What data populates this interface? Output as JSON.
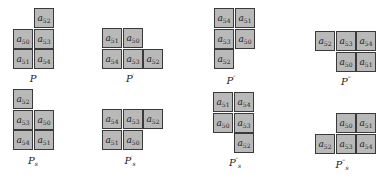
{
  "figure": {
    "cell_size": 20,
    "colors": {
      "cell_fill": "#b9b9b9",
      "cell_border": "#3a3a3a",
      "background": "#ffffff"
    },
    "polyominoes": [
      {
        "id": "P",
        "label": "P",
        "prime": "",
        "sub": "",
        "origin": [
          13,
          8
        ],
        "label_pos": [
          33,
          73
        ],
        "cells": [
          {
            "r": 0,
            "c": 1,
            "var": "a",
            "idx": "52"
          },
          {
            "r": 1,
            "c": 0,
            "var": "a",
            "idx": "50"
          },
          {
            "r": 1,
            "c": 1,
            "var": "a",
            "idx": "53"
          },
          {
            "r": 2,
            "c": 0,
            "var": "a",
            "idx": "51"
          },
          {
            "r": 2,
            "c": 1,
            "var": "a",
            "idx": "54"
          }
        ]
      },
      {
        "id": "P1",
        "label": "P",
        "prime": "′",
        "sub": "",
        "origin": [
          102,
          28
        ],
        "label_pos": [
          130,
          73
        ],
        "cells": [
          {
            "r": 0,
            "c": 0,
            "var": "a",
            "idx": "51"
          },
          {
            "r": 0,
            "c": 1,
            "var": "a",
            "idx": "50"
          },
          {
            "r": 1,
            "c": 0,
            "var": "a",
            "idx": "54"
          },
          {
            "r": 1,
            "c": 1,
            "var": "a",
            "idx": "53"
          },
          {
            "r": 1,
            "c": 2,
            "var": "a",
            "idx": "52"
          }
        ]
      },
      {
        "id": "P2",
        "label": "P",
        "prime": "″",
        "sub": "",
        "origin": [
          214,
          8
        ],
        "label_pos": [
          231,
          75
        ],
        "cells": [
          {
            "r": 0,
            "c": 0,
            "var": "a",
            "idx": "54"
          },
          {
            "r": 0,
            "c": 1,
            "var": "a",
            "idx": "51"
          },
          {
            "r": 1,
            "c": 0,
            "var": "a",
            "idx": "53"
          },
          {
            "r": 1,
            "c": 1,
            "var": "a",
            "idx": "50"
          },
          {
            "r": 2,
            "c": 0,
            "var": "a",
            "idx": "52"
          }
        ]
      },
      {
        "id": "P3",
        "label": "P",
        "prime": "‴",
        "sub": "",
        "origin": [
          315,
          31
        ],
        "label_pos": [
          346,
          76
        ],
        "cells": [
          {
            "r": 0,
            "c": 0,
            "var": "a",
            "idx": "52"
          },
          {
            "r": 0,
            "c": 1,
            "var": "a",
            "idx": "53"
          },
          {
            "r": 0,
            "c": 2,
            "var": "a",
            "idx": "54"
          },
          {
            "r": 1,
            "c": 1,
            "var": "a",
            "idx": "50"
          },
          {
            "r": 1,
            "c": 2,
            "var": "a",
            "idx": "51"
          }
        ]
      },
      {
        "id": "Ps",
        "label": "P",
        "prime": "",
        "sub": "s",
        "origin": [
          13,
          89
        ],
        "label_pos": [
          33,
          155
        ],
        "cells": [
          {
            "r": 0,
            "c": 0,
            "var": "a",
            "idx": "52"
          },
          {
            "r": 1,
            "c": 0,
            "var": "a",
            "idx": "53"
          },
          {
            "r": 1,
            "c": 1,
            "var": "a",
            "idx": "50"
          },
          {
            "r": 2,
            "c": 0,
            "var": "a",
            "idx": "54"
          },
          {
            "r": 2,
            "c": 1,
            "var": "a",
            "idx": "51"
          }
        ]
      },
      {
        "id": "P1s",
        "label": "P",
        "prime": "′",
        "sub": "s",
        "origin": [
          102,
          109
        ],
        "label_pos": [
          130,
          155
        ],
        "cells": [
          {
            "r": 0,
            "c": 0,
            "var": "a",
            "idx": "54"
          },
          {
            "r": 0,
            "c": 1,
            "var": "a",
            "idx": "53"
          },
          {
            "r": 0,
            "c": 2,
            "var": "a",
            "idx": "52"
          },
          {
            "r": 1,
            "c": 0,
            "var": "a",
            "idx": "51"
          },
          {
            "r": 1,
            "c": 1,
            "var": "a",
            "idx": "50"
          }
        ]
      },
      {
        "id": "P2s",
        "label": "P",
        "prime": "″",
        "sub": "s",
        "origin": [
          213,
          92
        ],
        "label_pos": [
          235,
          157
        ],
        "cells": [
          {
            "r": 0,
            "c": 0,
            "var": "a",
            "idx": "51"
          },
          {
            "r": 0,
            "c": 1,
            "var": "a",
            "idx": "54"
          },
          {
            "r": 1,
            "c": 0,
            "var": "a",
            "idx": "50"
          },
          {
            "r": 1,
            "c": 1,
            "var": "a",
            "idx": "53"
          },
          {
            "r": 2,
            "c": 1,
            "var": "a",
            "idx": "52"
          }
        ]
      },
      {
        "id": "P3s",
        "label": "P",
        "prime": "‴",
        "sub": "s",
        "origin": [
          315,
          113
        ],
        "label_pos": [
          342,
          159
        ],
        "cells": [
          {
            "r": 0,
            "c": 1,
            "var": "a",
            "idx": "50"
          },
          {
            "r": 0,
            "c": 2,
            "var": "a",
            "idx": "51"
          },
          {
            "r": 1,
            "c": 0,
            "var": "a",
            "idx": "52"
          },
          {
            "r": 1,
            "c": 1,
            "var": "a",
            "idx": "53"
          },
          {
            "r": 1,
            "c": 2,
            "var": "a",
            "idx": "54"
          }
        ]
      }
    ]
  }
}
